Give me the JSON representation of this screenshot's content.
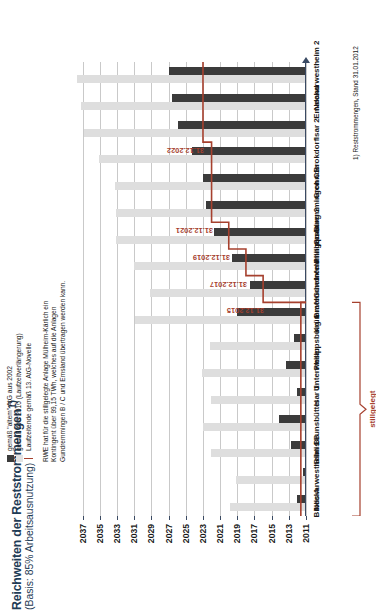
{
  "header": {
    "title": "Reichweiten der Reststrommengen",
    "title_sup": "1)",
    "subtitle": "(Basis: 85% Arbeitsausnutzung)"
  },
  "legend": {
    "items": [
      {
        "marker": "dark-square",
        "label": "gemäß \"altem\" AtG aus 2002"
      },
      {
        "marker": "light-square",
        "label": "gemäß AtG 2010 (Laufzeitverlängerung)"
      },
      {
        "marker": "red-line",
        "label": "Laufzeitende gemäß 13. AtG-Novelle"
      }
    ]
  },
  "note": {
    "lines": [
      "RWE hat für die stillgelegte Anlage Mülheim-Kärlich ein",
      "Kontingent über 99,15 TWh, welches auf die Anlagen",
      "Gundremmingen B / C und Emsland übertragen werden kann."
    ]
  },
  "bracket_label": "stillgelegt",
  "footnote": "1) Reststrommengen, Stand 31.01.2012",
  "chart_data": {
    "type": "bar",
    "title": "Reichweiten der Reststrommengen1)",
    "subtitle": "(Basis: 85% Arbeitsausnutzung)",
    "orientation": "vertical",
    "xlabel": "",
    "ylabel": "Jahr",
    "ylim": [
      2011,
      2038
    ],
    "grid": true,
    "legend_position": "top-right",
    "tick_labels": [
      "2011",
      "2013",
      "2015",
      "2017",
      "2019",
      "2021",
      "2023",
      "2025",
      "2027",
      "2029",
      "2031",
      "2033",
      "2035",
      "2037"
    ],
    "categories": [
      "Biblis A",
      "Neckarwestheim 1",
      "Biblis B",
      "Brunsbüttel",
      "Isar 1",
      "Unterweser",
      "Philippsburg 1",
      "Krümmel",
      "Grafenrheinfeld",
      "Gundremmingen B",
      "Philippsburg 2",
      "Gundremmingen C",
      "Grohnde",
      "Brokdorf",
      "Isar 2",
      "Emsland",
      "Neckarwestheim 2"
    ],
    "series": [
      {
        "name": "gemäß \"altem\" AtG aus 2002",
        "color": "#3b3b3b",
        "values": [
          2012.1,
          2011.3,
          2012.8,
          2014.2,
          2012.0,
          2013.3,
          2012.4,
          2019.0,
          2017.5,
          2019.6,
          2021.7,
          2022.6,
          2023.0,
          2024.3,
          2025.9,
          2026.6,
          2027.0
        ]
      },
      {
        "name": "gemäß AtG 2010 (Laufzeitverlängerung)",
        "color": "#dedede",
        "values": [
          2019.9,
          2019.2,
          2022.1,
          2023.0,
          2022.0,
          2023.1,
          2022.2,
          2030.9,
          2029.2,
          2031.0,
          2033.1,
          2033.1,
          2033.2,
          2035.1,
          2036.8,
          2037.2,
          2037.6
        ]
      }
    ],
    "step_line": {
      "name": "Laufzeitende gemäß 13. AtG-Novelle",
      "color": "#a6402e",
      "labels": [
        "31.12.2015",
        "31.12.2017",
        "31.12.2019",
        "31.12.2021",
        "31.12.2022"
      ],
      "steps": [
        {
          "label": "31.12.2015",
          "year": 2015.99,
          "from_category": "Grafenrheinfeld",
          "to_category": "Grafenrheinfeld"
        },
        {
          "label": "31.12.2017",
          "year": 2017.99,
          "from_category": "Gundremmingen B",
          "to_category": "Gundremmingen B"
        },
        {
          "label": "31.12.2019",
          "year": 2019.99,
          "from_category": "Philippsburg 2",
          "to_category": "Philippsburg 2"
        },
        {
          "label": "31.12.2021",
          "year": 2021.99,
          "from_category": "Gundremmingen C",
          "to_category": "Brokdorf"
        },
        {
          "label": "31.12.2022",
          "year": 2022.99,
          "from_category": "Isar 2",
          "to_category": "Neckarwestheim 2"
        }
      ]
    },
    "shutdown_bracket": {
      "label": "stillgelegt",
      "from_category": "Biblis A",
      "to_category": "Krümmel"
    }
  }
}
